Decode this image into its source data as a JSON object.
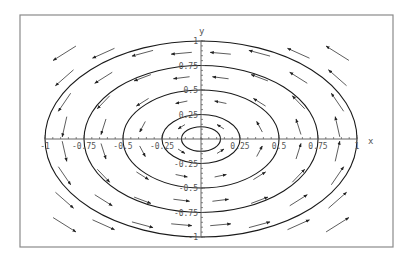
{
  "chart_data": {
    "type": "vector_field_with_streamlines",
    "title": "",
    "xlabel": "x",
    "ylabel": "y",
    "xlim": [
      -1,
      1
    ],
    "ylim": [
      -1,
      1
    ],
    "x_ticks": [
      -1,
      -0.75,
      -0.5,
      -0.25,
      0.25,
      0.5,
      0.75,
      1
    ],
    "x_tick_labels": [
      "-1",
      "-0.75",
      "-0.5",
      "-0.25",
      "0.25",
      "0.5",
      "0.75",
      "1"
    ],
    "y_ticks": [
      1,
      0.75,
      0.5,
      0.25,
      -0.25,
      -0.5,
      -0.75,
      -1
    ],
    "y_tick_labels": [
      "1",
      "0.75",
      "0.5",
      "0.25",
      "-0.25",
      "-0.5",
      "-0.75",
      "-1"
    ],
    "grid": false,
    "legend": null,
    "field_description": "Counterclockwise rotational field (circulation around origin)",
    "streamlines": [
      {
        "type": "ellipse",
        "rx": 0.125,
        "ry": 0.125
      },
      {
        "type": "ellipse",
        "rx": 0.25,
        "ry": 0.25
      },
      {
        "type": "ellipse",
        "rx": 0.5,
        "ry": 0.5
      },
      {
        "type": "ellipse",
        "rx": 0.75,
        "ry": 0.75
      },
      {
        "type": "ellipse",
        "rx": 1.0,
        "ry": 1.0
      }
    ],
    "vector_grid": {
      "x": [
        -0.875,
        -0.625,
        -0.375,
        -0.125,
        0.125,
        0.375,
        0.625,
        0.875
      ],
      "y": [
        0.875,
        0.625,
        0.375,
        0.125,
        -0.125,
        -0.375,
        -0.625,
        -0.875
      ],
      "direction": "counterclockwise"
    }
  },
  "axis_labels": {
    "x": "x",
    "y": "y"
  }
}
